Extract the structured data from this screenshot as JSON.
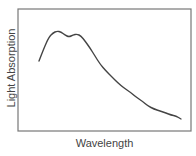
{
  "chart_data": {
    "type": "line",
    "title": "",
    "xlabel": "Wavelength",
    "ylabel": "Light Absorption",
    "x_ticks": [],
    "y_ticks": [],
    "grid": false,
    "legend": null,
    "frame": {
      "left": 18,
      "top": 9,
      "right": 191,
      "bottom": 131,
      "color": "#777777"
    },
    "line_color": "#444444",
    "series": [
      {
        "name": "absorption",
        "points_px": [
          [
            39,
            61
          ],
          [
            44,
            48
          ],
          [
            49,
            37
          ],
          [
            53,
            33
          ],
          [
            57,
            31
          ],
          [
            61,
            32
          ],
          [
            65,
            35
          ],
          [
            69,
            37
          ],
          [
            73,
            35
          ],
          [
            77,
            34
          ],
          [
            81,
            36
          ],
          [
            85,
            41
          ],
          [
            90,
            48
          ],
          [
            95,
            56
          ],
          [
            100,
            64
          ],
          [
            106,
            71
          ],
          [
            112,
            77
          ],
          [
            118,
            83
          ],
          [
            124,
            88
          ],
          [
            130,
            92
          ],
          [
            136,
            97
          ],
          [
            142,
            101
          ],
          [
            148,
            106
          ],
          [
            154,
            109
          ],
          [
            160,
            111
          ],
          [
            166,
            113
          ],
          [
            171,
            115
          ],
          [
            176,
            116
          ],
          [
            181,
            119
          ]
        ]
      }
    ]
  }
}
